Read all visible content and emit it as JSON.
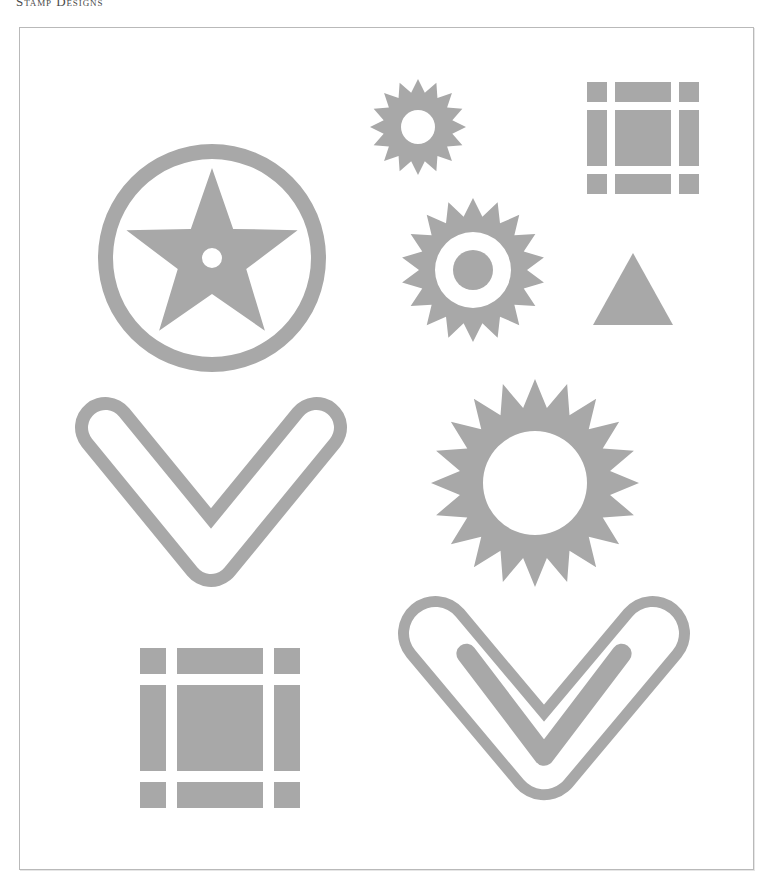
{
  "page": {
    "running_head": "Stamp Designs",
    "background_color": "#ffffff"
  },
  "plate": {
    "border_color": "#b9b9b9",
    "fill_color": "#ffffff",
    "x": 19,
    "y": 27,
    "width": 735,
    "height": 843
  },
  "palette": {
    "ink": "#a8a8a8",
    "paper": "#ffffff",
    "rule": "#b9b9b9",
    "text": "#4a4a4a"
  },
  "figures": [
    {
      "id": "star-in-circle",
      "name": "star-in-ring-stamp",
      "label": "Five-pointed star inside a ring",
      "shape": "star-in-ring",
      "points": 5,
      "x": 97,
      "y": 143,
      "size": 228,
      "ring_outer_radius": 114,
      "ring_thickness": 15,
      "star_outer_radius": 90,
      "star_inner_radius": 36,
      "center_hole_radius": 10,
      "color": "#a8a8a8"
    },
    {
      "id": "starburst-small",
      "name": "small-starburst-stamp",
      "label": "Small sixteen-point starburst, open centre",
      "shape": "starburst-ring",
      "points": 16,
      "x": 369,
      "y": 78,
      "size": 96,
      "outer_radius": 48,
      "inner_radius": 35,
      "hole_radius": 17,
      "color": "#a8a8a8"
    },
    {
      "id": "starburst-medium",
      "name": "medium-starburst-stamp",
      "label": "Medium starburst with ring and centre dot",
      "shape": "starburst-ring-dot",
      "points": 18,
      "x": 400,
      "y": 197,
      "size": 144,
      "outer_radius": 72,
      "inner_radius": 54,
      "hole_radius": 38,
      "dot_radius": 20,
      "color": "#a8a8a8"
    },
    {
      "id": "starburst-large",
      "name": "large-sunburst-stamp",
      "label": "Large twenty-point sunburst, open centre",
      "shape": "starburst-ring",
      "points": 20,
      "x": 430,
      "y": 378,
      "size": 208,
      "outer_radius": 104,
      "inner_radius": 76,
      "hole_radius": 52,
      "color": "#a8a8a8"
    },
    {
      "id": "grid-square-small",
      "name": "square-frame-stamp-small",
      "label": "Segmented square frame, small",
      "shape": "segmented-square",
      "x": 586,
      "y": 81,
      "size": 112,
      "corner": 20,
      "gap": 8,
      "color": "#a8a8a8"
    },
    {
      "id": "grid-square-large",
      "name": "square-frame-stamp-large",
      "label": "Segmented square frame, large",
      "shape": "segmented-square",
      "x": 139,
      "y": 647,
      "size": 160,
      "corner": 26,
      "gap": 11,
      "color": "#a8a8a8"
    },
    {
      "id": "triangle",
      "name": "triangle-stamp",
      "label": "Solid equilateral triangle",
      "shape": "triangle",
      "x": 592,
      "y": 252,
      "width": 80,
      "height": 72,
      "color": "#a8a8a8"
    },
    {
      "id": "chevron-single",
      "name": "chevron-outline-stamp",
      "label": "Outlined downward chevron",
      "shape": "chevron-outline",
      "x": 74,
      "y": 396,
      "width": 272,
      "height": 190,
      "stroke": 26,
      "color": "#a8a8a8"
    },
    {
      "id": "chevron-double",
      "name": "double-chevron-stamp",
      "label": "Outlined downward chevron with inner chevron",
      "shape": "chevron-double",
      "x": 397,
      "y": 595,
      "width": 292,
      "height": 222,
      "stroke": 22,
      "inner_stroke": 20,
      "color": "#a8a8a8"
    }
  ]
}
